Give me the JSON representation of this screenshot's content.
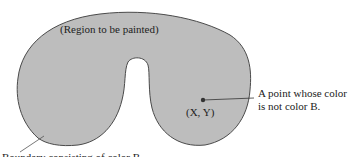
{
  "diagram": {
    "region_label": "(Region to be painted)",
    "point_label": "(X, Y)",
    "point_description_line1": "A point whose color",
    "point_description_line2": "is not color B.",
    "boundary_label": "Boundary consisting of color B"
  },
  "colors": {
    "region_fill": "#bdbdbd",
    "boundary_stroke": "#4a4a4a",
    "text": "#222222",
    "background": "#ffffff"
  }
}
